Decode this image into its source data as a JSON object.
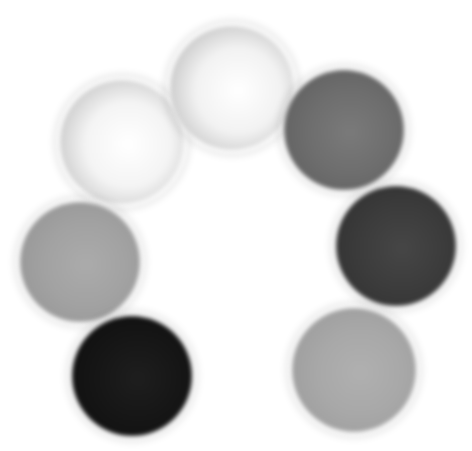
{
  "image": {
    "description": "Seven grayscale spheres arranged in an arc, open at the bottom",
    "background": "#ffffff"
  },
  "spheres": [
    {
      "id": "left-upper-white",
      "cx": 122,
      "cy": 142,
      "r": 62,
      "fill": "#f4f4f4",
      "edge": "#b8b8b8",
      "highlight": "#ffffff"
    },
    {
      "id": "top-white",
      "cx": 232,
      "cy": 88,
      "r": 62,
      "fill": "#f2f2f2",
      "edge": "#b4b4b4",
      "highlight": "#ffffff"
    },
    {
      "id": "right-upper-gray",
      "cx": 344,
      "cy": 130,
      "r": 60,
      "fill": "#6e6e6e",
      "edge": "#5e5e5e",
      "highlight": "#7a7a7a"
    },
    {
      "id": "left-mid-gray",
      "cx": 80,
      "cy": 262,
      "r": 60,
      "fill": "#a2a2a2",
      "edge": "#949494",
      "highlight": "#ababab"
    },
    {
      "id": "right-mid-dark",
      "cx": 396,
      "cy": 246,
      "r": 60,
      "fill": "#3c3c3c",
      "edge": "#303030",
      "highlight": "#464646"
    },
    {
      "id": "left-lower-black",
      "cx": 132,
      "cy": 376,
      "r": 60,
      "fill": "#161616",
      "edge": "#0e0e0e",
      "highlight": "#1e1e1e"
    },
    {
      "id": "right-lower-gray",
      "cx": 354,
      "cy": 370,
      "r": 62,
      "fill": "#a8a8a8",
      "edge": "#9a9a9a",
      "highlight": "#b0b0b0"
    }
  ]
}
